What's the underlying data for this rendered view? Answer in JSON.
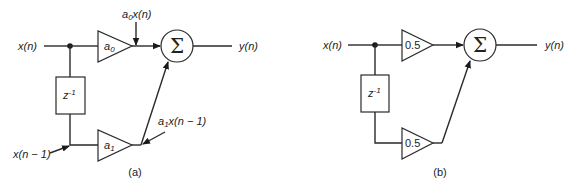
{
  "diagram_a": {
    "caption": "(a)",
    "input_label": "x(n)",
    "output_label": "y(n)",
    "delay_label_base": "z",
    "delay_label_exp": "-1",
    "gain_top_base": "a",
    "gain_top_sub": "0",
    "gain_bottom_base": "a",
    "gain_bottom_sub": "1",
    "top_product_label_base": "a",
    "top_product_label_sub": "0",
    "top_product_label_rest": "x(n)",
    "bottom_product_label_base": "a",
    "bottom_product_label_sub": "1",
    "bottom_product_label_rest": "x(n − 1)",
    "delayed_input_label": "x(n − 1)",
    "summer_symbol": "Σ"
  },
  "diagram_b": {
    "caption": "(b)",
    "input_label": "x(n)",
    "output_label": "y(n)",
    "delay_label_base": "z",
    "delay_label_exp": "-1",
    "gain_top": "0.5",
    "gain_bottom": "0.5",
    "summer_symbol": "Σ"
  },
  "colors": {
    "line": "#2a2a2a",
    "background": "#ffffff"
  }
}
